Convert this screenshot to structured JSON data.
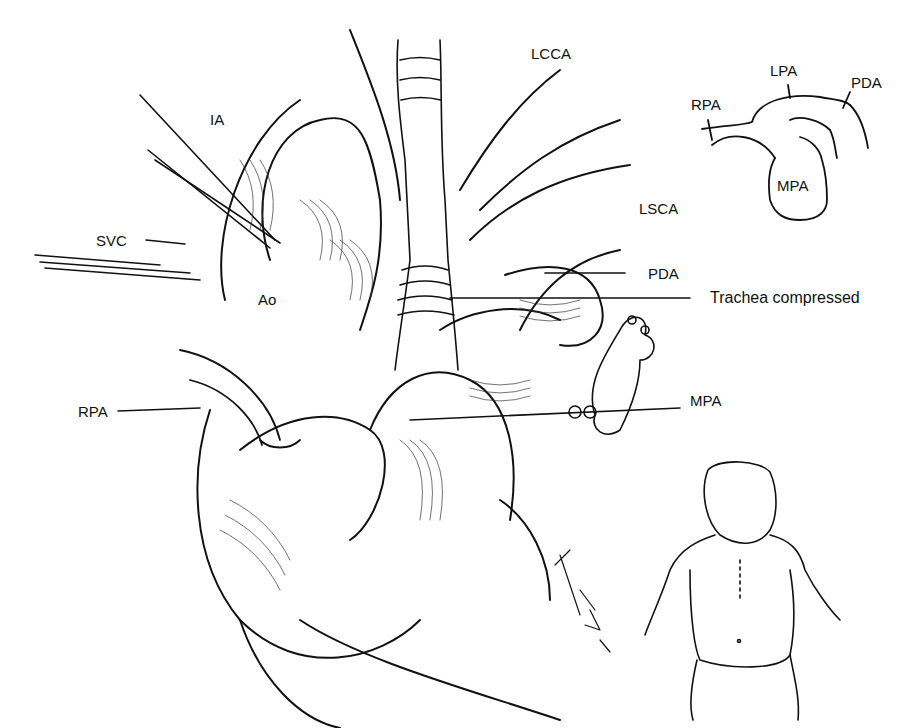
{
  "figure": {
    "caption_fragment": "",
    "main_illustration": {
      "subject": "Surgical view of mediastinum with great vessels; trachea compressed",
      "labels": [
        {
          "id": "IA",
          "text": "IA"
        },
        {
          "id": "SVC",
          "text": "SVC"
        },
        {
          "id": "Ao",
          "text": "Ao"
        },
        {
          "id": "RPA",
          "text": "RPA"
        },
        {
          "id": "LCCA",
          "text": "LCCA"
        },
        {
          "id": "LSCA",
          "text": "LSCA"
        },
        {
          "id": "PDA",
          "text": "PDA"
        },
        {
          "id": "trachea",
          "text": "Trachea compressed"
        },
        {
          "id": "MPA",
          "text": "MPA"
        }
      ]
    },
    "inset_schematic": {
      "labels": [
        {
          "id": "LPA",
          "text": "LPA"
        },
        {
          "id": "PDA",
          "text": "PDA"
        },
        {
          "id": "RPA",
          "text": "RPA"
        },
        {
          "id": "MPA",
          "text": "MPA"
        }
      ]
    },
    "inset_patient": {
      "subject": "Infant with midline sternotomy incision"
    },
    "signature": "Podesta"
  }
}
